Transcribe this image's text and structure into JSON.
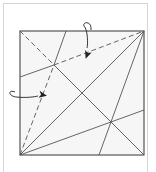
{
  "diagram": {
    "type": "origami-crease-pattern",
    "paper": {
      "x": 20,
      "y": 31,
      "width": 124,
      "height": 124,
      "fill": "#f6f6f6",
      "stroke": "#555555"
    },
    "colors": {
      "crease": "#555555",
      "arrow": "#222222",
      "frame": "#d6d6d6",
      "background": "#ffffff"
    },
    "creases": [
      {
        "id": "solid-anti-diagonal",
        "style": "solid",
        "x1": 20,
        "y1": 155,
        "x2": 144,
        "y2": 31
      },
      {
        "id": "solid-diagonal-lower",
        "style": "solid",
        "x1": 54,
        "y1": 65,
        "x2": 144,
        "y2": 155
      },
      {
        "id": "dashed-diagonal-upper",
        "style": "dashed",
        "x1": 20,
        "y1": 31,
        "x2": 54,
        "y2": 65
      },
      {
        "id": "dashed-to-corner-right",
        "style": "dashed",
        "x1": 54,
        "y1": 65,
        "x2": 144,
        "y2": 31
      },
      {
        "id": "solid-left-edge-segment",
        "style": "solid",
        "x1": 54,
        "y1": 65,
        "x2": 20,
        "y2": 77
      },
      {
        "id": "dashed-from-bottom-left",
        "style": "dashed",
        "x1": 20,
        "y1": 155,
        "x2": 54,
        "y2": 65
      },
      {
        "id": "solid-to-top-edge",
        "style": "solid",
        "x1": 54,
        "y1": 65,
        "x2": 66,
        "y2": 31
      },
      {
        "id": "solid-bottom-left-to-right-edge",
        "style": "solid",
        "x1": 20,
        "y1": 155,
        "x2": 144,
        "y2": 110
      },
      {
        "id": "solid-top-right-to-bottom-edge",
        "style": "solid",
        "x1": 144,
        "y1": 31,
        "x2": 99,
        "y2": 155
      }
    ],
    "arrows": [
      {
        "id": "fold-arrow-top",
        "label": "valley-fold-arrow",
        "path": "M 84 26 C 88 30, 88 45, 87 48",
        "start_hook": "M 84 26 C 82 22, 92 20, 91 30",
        "head": {
          "x": 87,
          "y": 55,
          "rotation": 200
        }
      },
      {
        "id": "fold-arrow-left",
        "label": "valley-fold-arrow",
        "path": "M 15 92 C 8 89, 8 96, 16 97 C 26 98, 34 97, 38 96",
        "head": {
          "x": 43,
          "y": 95,
          "rotation": 100
        }
      }
    ],
    "intersections": [
      {
        "x": 54,
        "y": 65
      },
      {
        "x": 82,
        "y": 93
      },
      {
        "x": 110,
        "y": 123
      }
    ]
  }
}
